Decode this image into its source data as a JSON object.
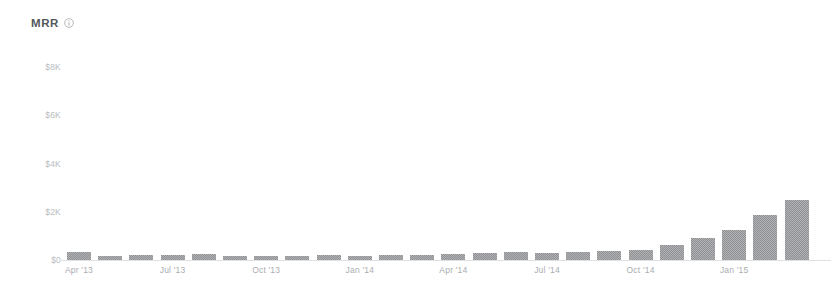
{
  "header": {
    "title": "MRR",
    "info_icon": "info-circle-icon"
  },
  "colors": {
    "bar": "#8e9093",
    "axis_text": "#b8bcc0",
    "title_text": "#54585c",
    "baseline": "#dfe1e3",
    "background": "#ffffff"
  },
  "chart_data": {
    "type": "bar",
    "title": "MRR",
    "xlabel": "",
    "ylabel": "",
    "ylim": [
      0,
      8000
    ],
    "grid": false,
    "legend": null,
    "y_tick_labels": [
      "$0",
      "$2K",
      "$4K",
      "$6K",
      "$8K"
    ],
    "y_tick_values": [
      0,
      2000,
      4000,
      6000,
      8000
    ],
    "x_tick_labels": [
      "Apr '13",
      "Jul '13",
      "Oct '13",
      "Jan '14",
      "Apr '14",
      "Jul '14",
      "Oct '14",
      "Jan '15"
    ],
    "x_tick_indices": [
      0,
      3,
      6,
      9,
      12,
      15,
      18,
      21
    ],
    "categories": [
      "Apr '13",
      "May '13",
      "Jun '13",
      "Jul '13",
      "Aug '13",
      "Sep '13",
      "Oct '13",
      "Nov '13",
      "Dec '13",
      "Jan '14",
      "Feb '14",
      "Mar '14",
      "Apr '14",
      "May '14",
      "Jun '14",
      "Jul '14",
      "Aug '14",
      "Sep '14",
      "Oct '14",
      "Nov '14",
      "Dec '14",
      "Jan '15",
      "Feb '15",
      "Mar '15"
    ],
    "values": [
      330,
      180,
      200,
      220,
      250,
      170,
      160,
      180,
      200,
      160,
      200,
      220,
      230,
      280,
      320,
      300,
      340,
      360,
      430,
      620,
      900,
      1250,
      1850,
      2500
    ]
  }
}
